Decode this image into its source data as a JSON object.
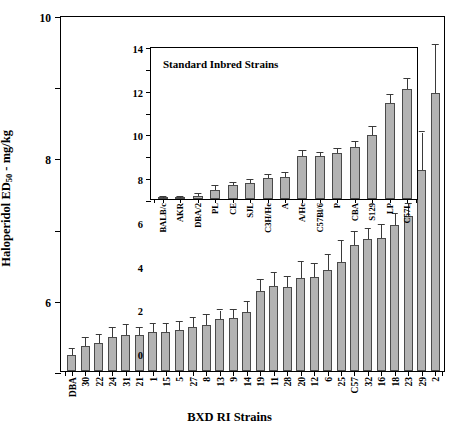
{
  "chart_data": {
    "type": "bar",
    "title": "",
    "xlabel": "BXD RI Strains",
    "ylabel": "Haloperidol ED50 - mg/kg",
    "ylabel_base": "Haloperidol ED",
    "ylabel_sub": "50",
    "ylabel_tail": " - mg/kg",
    "ylim": [
      0,
      10
    ],
    "yticks": [
      0,
      2,
      4,
      6,
      8,
      10
    ],
    "ytick_labels": [
      "0",
      "2",
      "4",
      "6",
      "8",
      "10"
    ],
    "grid": false,
    "legend": "none",
    "bar_color": "#b3b3b3",
    "bar_edge_color": "#4a4a4a",
    "errorbar_color": "#3a3a3a",
    "categories": [
      "DBA",
      "30",
      "22",
      "24",
      "31",
      "21",
      "1",
      "15",
      "5",
      "27",
      "8",
      "13",
      "9",
      "14",
      "19",
      "11",
      "28",
      "20",
      "12",
      "6",
      "25",
      "C57",
      "32",
      "16",
      "18",
      "23",
      "29",
      "2"
    ],
    "values": [
      0.45,
      0.7,
      0.8,
      0.95,
      1.0,
      1.0,
      1.1,
      1.1,
      1.15,
      1.25,
      1.3,
      1.45,
      1.5,
      1.65,
      2.25,
      2.4,
      2.35,
      2.6,
      2.65,
      2.85,
      3.05,
      3.55,
      3.7,
      3.75,
      4.1,
      4.35,
      5.65,
      7.8
    ],
    "errors": [
      0.18,
      0.22,
      0.22,
      0.25,
      0.28,
      0.22,
      0.22,
      0.22,
      0.22,
      0.25,
      0.28,
      0.25,
      0.22,
      0.3,
      0.32,
      0.35,
      0.28,
      0.45,
      0.35,
      0.4,
      0.6,
      0.35,
      0.3,
      0.35,
      0.3,
      0.35,
      1.05,
      1.35
    ],
    "inset": {
      "title": "Standard Inbred Strains",
      "ylim": [
        0,
        14
      ],
      "yticks": [
        0,
        2,
        4,
        6,
        8,
        10,
        12,
        14
      ],
      "ytick_labels": [
        "0",
        "2",
        "4",
        "6",
        "8",
        "10",
        "12",
        "14"
      ],
      "categories": [
        "BALB/c",
        "AKR",
        "DBA/2",
        "PL",
        "CE",
        "SJL",
        "C3H/He",
        "A",
        "A/He",
        "C57Bl/6",
        "P",
        "CBA",
        "S129",
        "LP",
        "C57L"
      ],
      "values": [
        0.1,
        0.15,
        0.3,
        0.85,
        1.25,
        1.45,
        1.9,
        2.05,
        3.9,
        3.95,
        4.2,
        4.75,
        5.85,
        8.75,
        10.1
      ],
      "errors": [
        0.05,
        0.07,
        0.12,
        0.3,
        0.22,
        0.3,
        0.3,
        0.3,
        0.45,
        0.3,
        0.38,
        0.48,
        0.7,
        0.75,
        0.85
      ]
    }
  }
}
